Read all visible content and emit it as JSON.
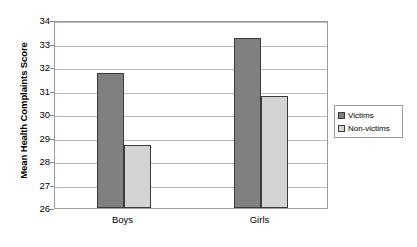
{
  "chart_data": {
    "type": "bar",
    "title": "",
    "xlabel": "",
    "ylabel": "Mean Health Complaints Score",
    "categories": [
      "Boys",
      "Girls"
    ],
    "ylim": [
      26,
      34
    ],
    "yticks": [
      26,
      27,
      28,
      29,
      30,
      31,
      32,
      33,
      34
    ],
    "ytick_labels": [
      "26",
      "27",
      "28",
      "29",
      "30",
      "31",
      "32",
      "33",
      "34"
    ],
    "grid": true,
    "legend_position": "right",
    "series": [
      {
        "name": "Victims",
        "color": "#808080",
        "values": [
          31.75,
          33.25
        ]
      },
      {
        "name": "Non-victims",
        "color": "#d4d4d4",
        "values": [
          28.7,
          30.75
        ]
      }
    ]
  }
}
